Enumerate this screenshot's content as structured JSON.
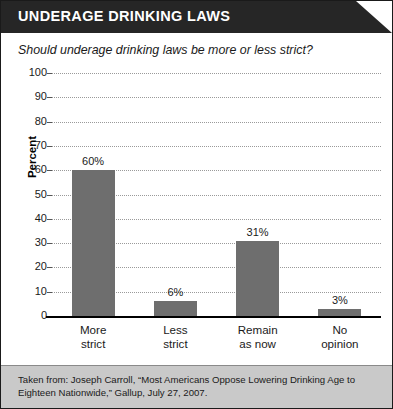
{
  "header": {
    "title": "UNDERAGE DRINKING LAWS",
    "background_color": "#262626",
    "text_color": "#ffffff"
  },
  "chart_data": {
    "type": "bar",
    "title": "UNDERAGE DRINKING LAWS",
    "subtitle": "Should underage drinking laws be more or less strict?",
    "categories": [
      "More strict",
      "Less strict",
      "Remain as now",
      "No opinion"
    ],
    "category_lines": [
      [
        "More",
        "strict"
      ],
      [
        "Less",
        "strict"
      ],
      [
        "Remain",
        "as now"
      ],
      [
        "No",
        "opinion"
      ]
    ],
    "values": [
      60,
      6,
      31,
      3
    ],
    "value_labels": [
      "60%",
      "6%",
      "31%",
      "3%"
    ],
    "xlabel": "",
    "ylabel": "Percent",
    "ylim": [
      0,
      100
    ],
    "ytick_step": 10,
    "ytick_labels": [
      "100",
      "90",
      "80",
      "70",
      "60",
      "50",
      "40",
      "30",
      "20",
      "10",
      "0"
    ],
    "grid": true,
    "grid_axis": "y",
    "grid_style": "dotted",
    "legend": false,
    "bar_color": "#6e6e6e",
    "background_color": "#ffffff"
  },
  "footer": {
    "line1": "Taken from: Joseph Carroll, “Most Americans Oppose Lowering Drinking Age to Eighteen",
    "line2": "Nationwide,” Gallup, July 27, 2007.",
    "background_color": "#c9c9c9"
  }
}
